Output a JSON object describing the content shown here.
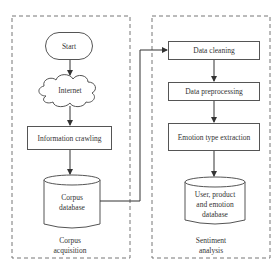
{
  "diagram": {
    "groups": [
      {
        "id": "left",
        "label_line1": "Corpus",
        "label_line2": "acquisition"
      },
      {
        "id": "right",
        "label_line1": "Sentiment",
        "label_line2": "analysis"
      }
    ],
    "nodes": {
      "start": {
        "label": "Start",
        "shape": "rounded"
      },
      "internet": {
        "label": "Internet",
        "shape": "cloud"
      },
      "crawling": {
        "label": "Information crawling",
        "shape": "rect"
      },
      "corpus_db": {
        "label_line1": "Corpus",
        "label_line2": "database",
        "shape": "cylinder"
      },
      "cleaning": {
        "label": "Data cleaning",
        "shape": "rect"
      },
      "preprocessing": {
        "label": "Data preprocessing",
        "shape": "rect"
      },
      "extraction": {
        "label": "Emotion type extraction",
        "shape": "rect"
      },
      "user_db": {
        "label_line1": "User, product",
        "label_line2": "and emotion",
        "label_line3": "database",
        "shape": "cylinder"
      }
    },
    "edges": [
      [
        "start",
        "internet"
      ],
      [
        "internet",
        "crawling"
      ],
      [
        "crawling",
        "corpus_db"
      ],
      [
        "corpus_db",
        "cleaning"
      ],
      [
        "cleaning",
        "preprocessing"
      ],
      [
        "preprocessing",
        "extraction"
      ],
      [
        "extraction",
        "user_db"
      ]
    ],
    "colors": {
      "line": "#444444",
      "dash": "#777777",
      "background": "#ffffff"
    }
  }
}
